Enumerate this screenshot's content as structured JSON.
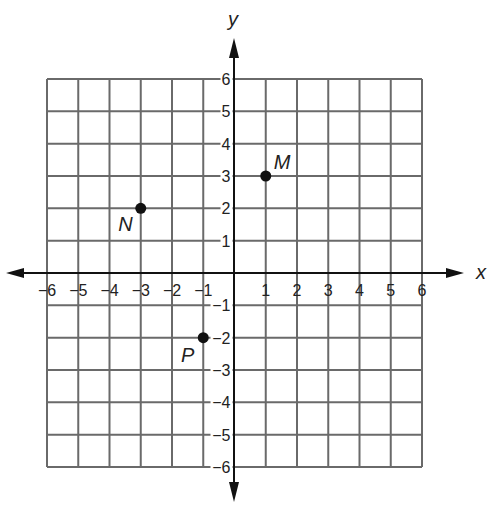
{
  "chart_data": {
    "type": "scatter",
    "title": "",
    "xlabel": "x",
    "ylabel": "y",
    "xlim": [
      -6,
      6
    ],
    "ylim": [
      -6,
      6
    ],
    "grid": true,
    "x_ticks": [
      -6,
      -5,
      -4,
      -3,
      -2,
      -1,
      1,
      2,
      3,
      4,
      5,
      6
    ],
    "y_ticks": [
      -6,
      -5,
      -4,
      -3,
      -2,
      -1,
      1,
      2,
      3,
      4,
      5,
      6
    ],
    "x_tick_labels": [
      "−6",
      "−5",
      "−4",
      "−3",
      "−2",
      "−1",
      "1",
      "2",
      "3",
      "4",
      "5",
      "6"
    ],
    "y_tick_labels": [
      "−6",
      "−5",
      "−4",
      "−3",
      "−2",
      "−1",
      "1",
      "2",
      "3",
      "4",
      "5",
      "6"
    ],
    "points": [
      {
        "label": "M",
        "x": 1,
        "y": 3
      },
      {
        "label": "N",
        "x": -3,
        "y": 2
      },
      {
        "label": "P",
        "x": -1,
        "y": -2
      }
    ],
    "colors": {
      "grid": "#6a6a6a",
      "axis": "#111111",
      "point": "#111111",
      "text": "#222222"
    }
  }
}
